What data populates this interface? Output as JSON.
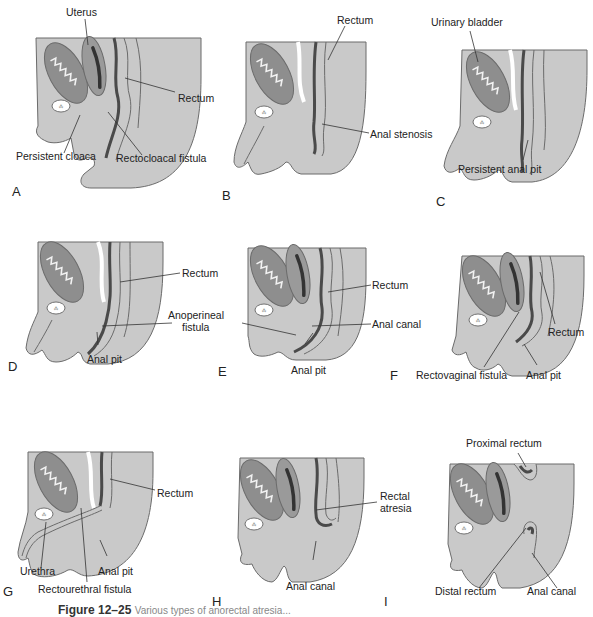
{
  "figure": {
    "caption_label": "Figure 12–25",
    "caption_text": "Various types of anorectal atresia..."
  },
  "colors": {
    "tissue_fill": "#c9c9c9",
    "organ_fill": "#8e8e8e",
    "lumen_dark": "#4a4a4a",
    "outline": "#6b6b6b",
    "background": "#ffffff"
  },
  "panels": [
    {
      "letter": "A",
      "labels": [
        "Uterus",
        "Rectum",
        "Persistent cloaca",
        "Rectocloacal fistula"
      ]
    },
    {
      "letter": "B",
      "labels": [
        "Rectum",
        "Anal stenosis"
      ]
    },
    {
      "letter": "C",
      "labels": [
        "Urinary bladder",
        "Persistent anal pit"
      ]
    },
    {
      "letter": "D",
      "labels": [
        "Rectum",
        "Anoperineal fistula",
        "Anal pit"
      ]
    },
    {
      "letter": "E",
      "labels": [
        "Rectum",
        "Anal canal",
        "Anal pit"
      ]
    },
    {
      "letter": "F",
      "labels": [
        "Rectum",
        "Rectovaginal fistula",
        "Anal pit"
      ]
    },
    {
      "letter": "G",
      "labels": [
        "Rectum",
        "Urethra",
        "Anal pit",
        "Rectourethral fistula"
      ]
    },
    {
      "letter": "H",
      "labels": [
        "Rectal atresia",
        "Anal canal"
      ]
    },
    {
      "letter": "I",
      "labels": [
        "Proximal rectum",
        "Distal rectum",
        "Anal canal"
      ]
    }
  ],
  "labels": {
    "a_uterus": "Uterus",
    "a_rectum": "Rectum",
    "a_cloaca": "Persistent cloaca",
    "a_fistula": "Rectocloacal fistula",
    "b_rectum": "Rectum",
    "b_stenosis": "Anal stenosis",
    "c_bladder": "Urinary bladder",
    "c_pit": "Persistent anal pit",
    "d_rectum": "Rectum",
    "d_fistula_1": "Anoperineal",
    "d_fistula_2": "fistula",
    "d_pit": "Anal pit",
    "e_rectum": "Rectum",
    "e_canal": "Anal canal",
    "e_pit": "Anal pit",
    "f_rectum": "Rectum",
    "f_fistula": "Rectovaginal fistula",
    "f_pit": "Anal pit",
    "g_rectum": "Rectum",
    "g_urethra": "Urethra",
    "g_pit": "Anal pit",
    "g_fistula": "Rectourethral fistula",
    "h_atresia_1": "Rectal",
    "h_atresia_2": "atresia",
    "h_canal": "Anal canal",
    "i_proximal": "Proximal rectum",
    "i_distal": "Distal rectum",
    "i_canal": "Anal canal"
  },
  "letters": {
    "A": "A",
    "B": "B",
    "C": "C",
    "D": "D",
    "E": "E",
    "F": "F",
    "G": "G",
    "H": "H",
    "I": "I"
  }
}
